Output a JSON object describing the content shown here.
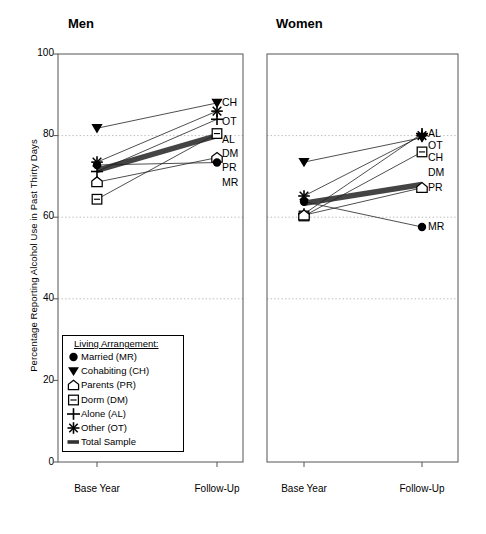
{
  "axis": {
    "ylabel": "Percentage Reporting Alcohol Use in Past Thirty Days",
    "yticks": [
      "100",
      "80",
      "60",
      "40",
      "20",
      "0"
    ],
    "xticks": [
      "Base Year",
      "Follow-Up"
    ]
  },
  "panels": [
    {
      "title": "Men"
    },
    {
      "title": "Women"
    }
  ],
  "legend": {
    "title": "Living Arrangement:",
    "items": [
      {
        "label": "Married (MR)",
        "glyph": "filled-circle",
        "code": "MR"
      },
      {
        "label": "Cohabiting (CH)",
        "glyph": "filled-down-triangle",
        "code": "CH"
      },
      {
        "label": "Parents (PR)",
        "glyph": "house-pentagon",
        "code": "PR"
      },
      {
        "label": "Dorm (DM)",
        "glyph": "square-with-bar",
        "code": "DM"
      },
      {
        "label": "Alone (AL)",
        "glyph": "plus",
        "code": "AL"
      },
      {
        "label": "Other (OT)",
        "glyph": "six-point-star",
        "code": "OT"
      },
      {
        "label": "Total Sample",
        "glyph": "thick-bar",
        "code": "TS"
      }
    ]
  },
  "chart_data": {
    "type": "line",
    "title": "",
    "xlabel": "",
    "ylabel": "Percentage Reporting Alcohol Use in Past Thirty Days",
    "x": [
      "Base Year",
      "Follow-Up"
    ],
    "ylim": [
      0,
      100
    ],
    "yticks": [
      0,
      20,
      40,
      60,
      80,
      100
    ],
    "gridlines": [
      40,
      60,
      80
    ],
    "grid": true,
    "legend_position": "inside-lower-left",
    "panels": [
      {
        "name": "Men",
        "series": [
          {
            "name": "Cohabiting (CH)",
            "code": "CH",
            "marker": "filled-down-triangle",
            "values": [
              81.8,
              88.0
            ],
            "end_label": "CH"
          },
          {
            "name": "Other (OT)",
            "code": "OT",
            "marker": "six-point-star",
            "values": [
              73.5,
              86.0
            ],
            "end_label": "OT"
          },
          {
            "name": "Alone (AL)",
            "code": "AL",
            "marker": "plus",
            "values": [
              71.2,
              84.0
            ],
            "end_label": "AL"
          },
          {
            "name": "Dorm (DM)",
            "code": "DM",
            "marker": "square-with-bar",
            "values": [
              64.4,
              80.5
            ],
            "end_label": "DM"
          },
          {
            "name": "Parents (PR)",
            "code": "PR",
            "marker": "house-pentagon",
            "values": [
              68.6,
              74.6
            ],
            "end_label": "PR"
          },
          {
            "name": "Married (MR)",
            "code": "MR",
            "marker": "filled-circle",
            "values": [
              72.8,
              73.4
            ],
            "end_label": "MR"
          },
          {
            "name": "Total Sample",
            "code": "TS",
            "marker": "thick-bar",
            "values": [
              71.5,
              80.0
            ],
            "end_label": ""
          }
        ]
      },
      {
        "name": "Women",
        "series": [
          {
            "name": "Alone (AL)",
            "code": "AL",
            "marker": "plus",
            "values": [
              60.8,
              80.5
            ],
            "end_label": "AL"
          },
          {
            "name": "Other (OT)",
            "code": "OT",
            "marker": "six-point-star",
            "values": [
              65.2,
              80.0
            ],
            "end_label": "OT"
          },
          {
            "name": "Cohabiting (CH)",
            "code": "CH",
            "marker": "filled-down-triangle",
            "values": [
              73.5,
              79.5
            ],
            "end_label": "CH"
          },
          {
            "name": "Dorm (DM)",
            "code": "DM",
            "marker": "square-with-bar",
            "values": [
              60.3,
              76.0
            ],
            "end_label": "DM"
          },
          {
            "name": "Parents (PR)",
            "code": "PR",
            "marker": "house-pentagon",
            "values": [
              60.5,
              67.2
            ],
            "end_label": "PR"
          },
          {
            "name": "Married (MR)",
            "code": "MR",
            "marker": "filled-circle",
            "values": [
              63.8,
              57.6
            ],
            "end_label": "MR"
          },
          {
            "name": "Total Sample",
            "code": "TS",
            "marker": "thick-bar",
            "values": [
              63.4,
              68.0
            ],
            "end_label": ""
          }
        ]
      }
    ]
  },
  "colors": {
    "line": "#222222",
    "marker": "#000000",
    "grid": "#bbbbbb",
    "frame": "#555555",
    "total_sample": "#444444"
  }
}
